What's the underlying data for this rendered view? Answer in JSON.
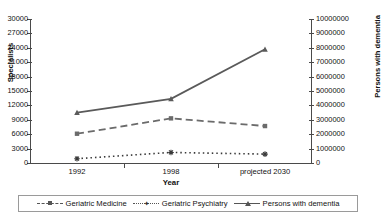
{
  "chart_data": {
    "type": "line",
    "title": "",
    "xlabel": "Year",
    "categories": [
      "1992",
      "1998",
      "projected 2030"
    ],
    "y_left": {
      "label": "Specialists",
      "ylim": [
        0,
        30000
      ],
      "ticks": [
        "0",
        "3000",
        "6000",
        "9000",
        "12000",
        "15000",
        "18000",
        "21000",
        "24000",
        "27000",
        "30000"
      ]
    },
    "y_right": {
      "label": "Persons with dementia",
      "ylim": [
        0,
        10000000
      ],
      "ticks": [
        "0",
        "1000000",
        "2000000",
        "3000000",
        "4000000",
        "5000000",
        "6000000",
        "7000000",
        "8000000",
        "9000000",
        "10000000"
      ]
    },
    "grid": false,
    "legend_position": "bottom",
    "series": [
      {
        "name": "Geriatric Medicine",
        "axis": "left",
        "line_style": "dashed",
        "marker": "square",
        "color": "#6b6b6b",
        "values": [
          6100,
          9300,
          7700
        ]
      },
      {
        "name": "Geriatric Psychiatry",
        "axis": "left",
        "line_style": "dotted",
        "marker": "plus",
        "color": "#3a3a3a",
        "values": [
          900,
          2200,
          1850
        ]
      },
      {
        "name": "Persons with dementia",
        "axis": "right",
        "line_style": "solid",
        "marker": "triangle",
        "color": "#5a5a5a",
        "values": [
          3500000,
          4450000,
          7900000
        ]
      }
    ]
  },
  "axes": {
    "x_title": "Year",
    "y_left_title": "Specialists",
    "y_right_title": "Persons with dementia",
    "x_tick_labels": [
      "1992",
      "1998",
      "projected 2030"
    ],
    "y_left_tick_labels": [
      "30000",
      "27000",
      "24000",
      "21000",
      "18000",
      "15000",
      "12000",
      "9000",
      "6000",
      "3000",
      "0"
    ],
    "y_right_tick_labels": [
      "10000000",
      "9000000",
      "8000000",
      "7000000",
      "6000000",
      "5000000",
      "4000000",
      "3000000",
      "2000000",
      "1000000",
      "0"
    ]
  },
  "legend": {
    "items": [
      {
        "label": "Geriatric Medicine"
      },
      {
        "label": "Geriatric Psychiatry"
      },
      {
        "label": "Persons with dementia"
      }
    ]
  }
}
